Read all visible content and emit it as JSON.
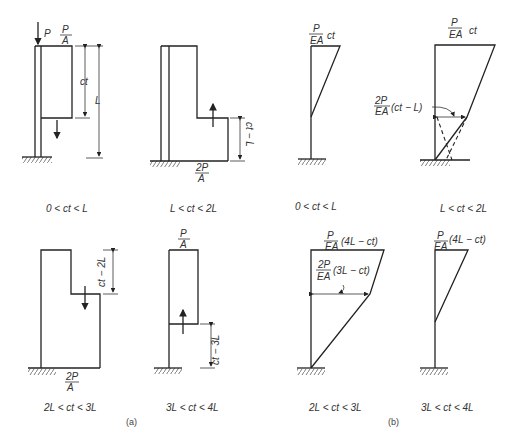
{
  "figure": {
    "part_a_label": "(a)",
    "part_b_label": "(b)",
    "panels": [
      {
        "id": "a1",
        "range": "0 < ct < L",
        "labels": {
          "load": "P",
          "stress_num": "P",
          "stress_den": "A",
          "dim_ct": "ct",
          "dim_L": "L"
        }
      },
      {
        "id": "a2",
        "range": "L < ct < 2L",
        "labels": {
          "stress_num": "2P",
          "stress_den": "A",
          "dim": "ct − L"
        }
      },
      {
        "id": "b1",
        "range": "0 < ct < L",
        "labels": {
          "num": "P",
          "den": "EA",
          "tail": "ct"
        }
      },
      {
        "id": "b2",
        "range": "L < ct < 2L",
        "labels": {
          "num": "P",
          "den": "EA",
          "tail": "ct",
          "num2": "2P",
          "den2": "EA",
          "tail2": "(ct − L)"
        }
      },
      {
        "id": "a3",
        "range": "2L < ct < 3L",
        "labels": {
          "stress_num": "2P",
          "stress_den": "A",
          "dim": "ct − 2L"
        }
      },
      {
        "id": "a4",
        "range": "3L < ct < 4L",
        "labels": {
          "stress_num": "P",
          "stress_den": "A",
          "dim": "ct − 3L"
        }
      },
      {
        "id": "b3",
        "range": "2L < ct < 3L",
        "labels": {
          "num": "P",
          "den": "EA",
          "tail": "(4L − ct)",
          "num2": "2P",
          "den2": "EA",
          "tail2": "(3L − ct)"
        }
      },
      {
        "id": "b4",
        "range": "3L < ct < 4L",
        "labels": {
          "num": "P",
          "den": "EA",
          "tail": "(4L − ct)"
        }
      }
    ]
  }
}
